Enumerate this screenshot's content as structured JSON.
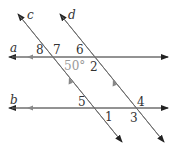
{
  "diagram": {
    "lines": {
      "a": "a",
      "b": "b",
      "c": "c",
      "d": "d"
    },
    "angles": {
      "n1": "1",
      "n2": "2",
      "n3": "3",
      "n4": "4",
      "n5": "5",
      "n6": "6",
      "n7": "7",
      "n8": "8",
      "given": "50°"
    },
    "colors": {
      "line": "#6e6e6e",
      "arrow": "#222222",
      "text": "#333333",
      "given_angle": "#999999"
    }
  }
}
